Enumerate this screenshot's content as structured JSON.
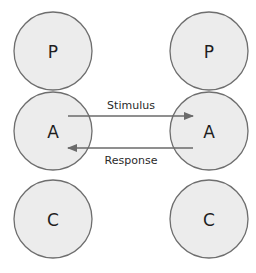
{
  "diagram": {
    "type": "transactional-analysis",
    "left_person": {
      "states": [
        {
          "label": "P",
          "cx": 53,
          "cy": 51
        },
        {
          "label": "A",
          "cx": 53,
          "cy": 131
        },
        {
          "label": "C",
          "cx": 53,
          "cy": 219
        }
      ]
    },
    "right_person": {
      "states": [
        {
          "label": "P",
          "cx": 209,
          "cy": 51
        },
        {
          "label": "A",
          "cx": 209,
          "cy": 131
        },
        {
          "label": "C",
          "cx": 209,
          "cy": 219
        }
      ]
    },
    "transactions": [
      {
        "label": "Stimulus",
        "from": "left.A",
        "to": "right.A",
        "direction": "right"
      },
      {
        "label": "Response",
        "from": "right.A",
        "to": "left.A",
        "direction": "left"
      }
    ],
    "colors": {
      "circle_fill": "#ececec",
      "circle_stroke": "#6e6e6e",
      "arrow": "#6a6a6a",
      "text": "#1e1e1e"
    }
  }
}
